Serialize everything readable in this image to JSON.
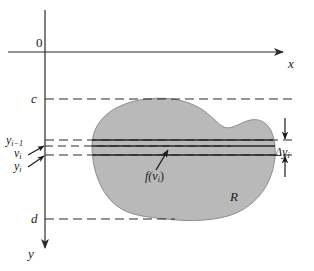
{
  "figure": {
    "type": "math-diagram",
    "background_color": "#ffffff",
    "line_color": "#2b2b2b",
    "region_fill_color": "#b9b9b9",
    "region_stroke_color": "#7a7a7a"
  },
  "axes": {
    "origin_label": "0",
    "x_axis_label": "x",
    "y_axis_label": "y",
    "x_axis_direction": "right",
    "y_axis_direction": "down",
    "x_axis_y_px": 52,
    "y_axis_x_px": 45
  },
  "guides": [
    {
      "name": "c",
      "label": "c",
      "y_px": 99,
      "style": "dashed"
    },
    {
      "name": "y_i_1",
      "label": "y",
      "sub": "i−1",
      "y_px": 140,
      "style": "dashed"
    },
    {
      "name": "v_i",
      "label": "v",
      "sub": "i",
      "y_px": 146,
      "style": "dashed"
    },
    {
      "name": "y_i",
      "label": "y",
      "sub": "i",
      "y_px": 155,
      "style": "dashed"
    },
    {
      "name": "d",
      "label": "d",
      "y_px": 219,
      "style": "dashed"
    }
  ],
  "labels": {
    "origin": "0",
    "x_axis": "x",
    "y_axis": "y",
    "c": "c",
    "d": "d",
    "y_i_minus_1_base": "y",
    "y_i_minus_1_sub": "i−1",
    "v_i_base": "v",
    "v_i_sub": "i",
    "y_i_base": "y",
    "y_i_sub": "i",
    "delta_y_i_base": "Δy",
    "delta_y_i_sub": "i",
    "f_of_v_i_prefix": "f(v",
    "f_of_v_i_sub": "i",
    "f_of_v_i_suffix": ")",
    "region": "R"
  },
  "region": {
    "name": "R",
    "label": "R",
    "label_x_px": 230,
    "label_y_px": 190
  },
  "strip": {
    "top_line_y_px": 140,
    "middle_line_y_px": 146,
    "bottom_line_y_px": 155,
    "thickness_label": "Δy",
    "thickness_label_sub": "i",
    "sample_value_label": "f(v"
  },
  "annotations": [
    {
      "name": "f-of-v-i-leader",
      "text": "f(v_i)",
      "points_to": "middle strip line"
    },
    {
      "name": "delta-y-i-dimension",
      "text": "Δy_i",
      "points_to": "strip thickness between y_{i-1} and y_i"
    },
    {
      "name": "v-i-leader",
      "text": "v_i",
      "points_to": "v_i dashed line on y-axis"
    },
    {
      "name": "y-i-leader",
      "text": "y_i",
      "points_to": "y_i dashed line on y-axis"
    }
  ]
}
